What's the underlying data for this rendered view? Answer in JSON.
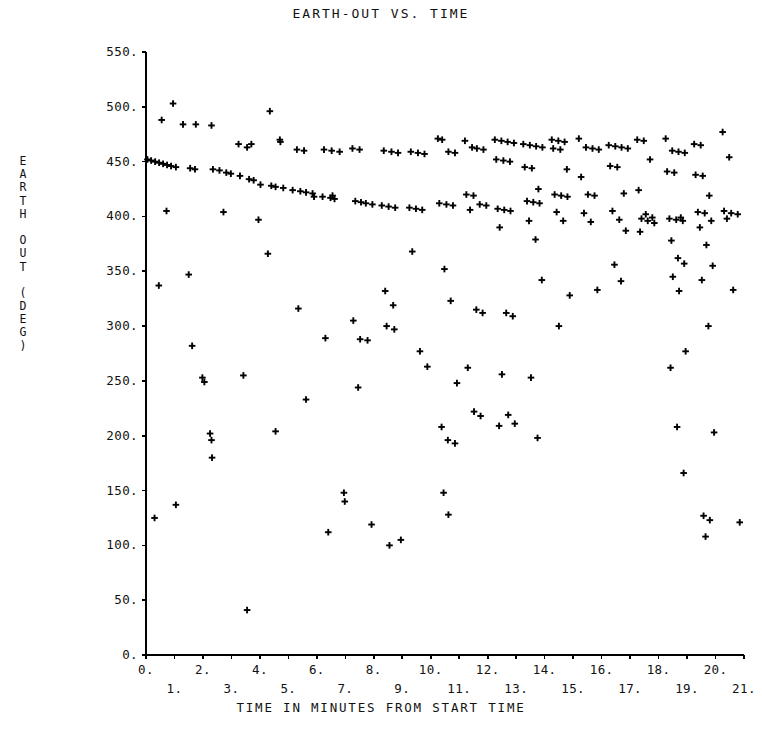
{
  "chart_data": {
    "type": "scatter",
    "title": "EARTH-OUT VS. TIME",
    "xlabel": "TIME IN MINUTES FROM START TIME",
    "ylabel": "EARTH OUT (DEG)",
    "ylabel_chars": [
      "E",
      "A",
      "R",
      "T",
      "H",
      "",
      "O",
      "U",
      "T",
      "",
      "(",
      "D",
      "E",
      "G",
      ")"
    ],
    "xlim": [
      0,
      21
    ],
    "ylim": [
      0,
      550
    ],
    "grid": false,
    "legend": "none",
    "marker": "plus",
    "marker_color": "#000000",
    "xticks": [
      0,
      1,
      2,
      3,
      4,
      5,
      6,
      7,
      8,
      9,
      10,
      11,
      12,
      13,
      14,
      15,
      16,
      17,
      18,
      19,
      20,
      21
    ],
    "xtick_labels_even": [
      "0.",
      "2.",
      "4.",
      "6.",
      "8.",
      "10.",
      "12.",
      "14.",
      "16.",
      "18.",
      "20."
    ],
    "xtick_labels_odd": [
      "1.",
      "3.",
      "5.",
      "7.",
      "9.",
      "11.",
      "13.",
      "15.",
      "17.",
      "19.",
      "21."
    ],
    "yticks": [
      0,
      50,
      100,
      150,
      200,
      250,
      300,
      350,
      400,
      450,
      500,
      550
    ],
    "ytick_labels": [
      "0.",
      "50.",
      "100.",
      "150.",
      "200.",
      "250.",
      "300.",
      "350.",
      "400.",
      "450.",
      "500.",
      "550."
    ],
    "points": [
      [
        0.05,
        452
      ],
      [
        0.18,
        451
      ],
      [
        0.32,
        450
      ],
      [
        0.46,
        449
      ],
      [
        0.6,
        448
      ],
      [
        0.74,
        447
      ],
      [
        0.88,
        446
      ],
      [
        1.05,
        445
      ],
      [
        0.55,
        488
      ],
      [
        0.95,
        503
      ],
      [
        1.3,
        484
      ],
      [
        1.75,
        484
      ],
      [
        1.55,
        444
      ],
      [
        1.72,
        443
      ],
      [
        0.72,
        405
      ],
      [
        0.45,
        337
      ],
      [
        1.05,
        137
      ],
      [
        0.3,
        125
      ],
      [
        2.3,
        483
      ],
      [
        2.35,
        443
      ],
      [
        2.58,
        442
      ],
      [
        2.82,
        440
      ],
      [
        2.98,
        439
      ],
      [
        1.62,
        282
      ],
      [
        1.5,
        347
      ],
      [
        2.05,
        249
      ],
      [
        2.25,
        202
      ],
      [
        2.3,
        196
      ],
      [
        2.32,
        180
      ],
      [
        1.98,
        253
      ],
      [
        2.72,
        404
      ],
      [
        3.55,
        41
      ],
      [
        3.42,
        255
      ],
      [
        3.25,
        466
      ],
      [
        3.7,
        466
      ],
      [
        3.55,
        463
      ],
      [
        3.3,
        437
      ],
      [
        3.62,
        434
      ],
      [
        3.78,
        433
      ],
      [
        4.02,
        429
      ],
      [
        3.95,
        397
      ],
      [
        4.35,
        496
      ],
      [
        4.7,
        470
      ],
      [
        4.72,
        468
      ],
      [
        4.4,
        428
      ],
      [
        4.55,
        427
      ],
      [
        4.82,
        426
      ],
      [
        4.28,
        366
      ],
      [
        4.55,
        204
      ],
      [
        5.3,
        461
      ],
      [
        5.55,
        460
      ],
      [
        5.15,
        424
      ],
      [
        5.42,
        423
      ],
      [
        5.62,
        422
      ],
      [
        5.85,
        421
      ],
      [
        5.9,
        418
      ],
      [
        5.35,
        316
      ],
      [
        5.62,
        233
      ],
      [
        6.25,
        461
      ],
      [
        6.52,
        460
      ],
      [
        6.8,
        459
      ],
      [
        6.2,
        418
      ],
      [
        6.48,
        417
      ],
      [
        6.62,
        416
      ],
      [
        6.55,
        419
      ],
      [
        6.3,
        289
      ],
      [
        6.95,
        148
      ],
      [
        6.98,
        140
      ],
      [
        6.4,
        112
      ],
      [
        7.25,
        462
      ],
      [
        7.5,
        461
      ],
      [
        7.35,
        414
      ],
      [
        7.55,
        413
      ],
      [
        7.72,
        412
      ],
      [
        7.95,
        411
      ],
      [
        7.28,
        305
      ],
      [
        7.52,
        288
      ],
      [
        7.78,
        287
      ],
      [
        7.45,
        244
      ],
      [
        7.92,
        119
      ],
      [
        8.35,
        460
      ],
      [
        8.62,
        459
      ],
      [
        8.85,
        458
      ],
      [
        8.28,
        410
      ],
      [
        8.52,
        409
      ],
      [
        8.75,
        408
      ],
      [
        8.4,
        332
      ],
      [
        8.68,
        319
      ],
      [
        8.45,
        300
      ],
      [
        8.72,
        297
      ],
      [
        8.95,
        105
      ],
      [
        8.55,
        100
      ],
      [
        9.3,
        459
      ],
      [
        9.55,
        458
      ],
      [
        9.78,
        457
      ],
      [
        9.25,
        408
      ],
      [
        9.48,
        407
      ],
      [
        9.7,
        406
      ],
      [
        9.35,
        368
      ],
      [
        9.62,
        277
      ],
      [
        9.88,
        263
      ],
      [
        10.25,
        471
      ],
      [
        10.4,
        470
      ],
      [
        10.62,
        459
      ],
      [
        10.85,
        458
      ],
      [
        10.3,
        412
      ],
      [
        10.55,
        411
      ],
      [
        10.78,
        410
      ],
      [
        10.48,
        352
      ],
      [
        10.7,
        323
      ],
      [
        10.92,
        248
      ],
      [
        10.38,
        208
      ],
      [
        10.6,
        196
      ],
      [
        10.85,
        193
      ],
      [
        10.45,
        148
      ],
      [
        10.62,
        128
      ],
      [
        11.2,
        469
      ],
      [
        11.45,
        463
      ],
      [
        11.62,
        462
      ],
      [
        11.85,
        461
      ],
      [
        11.25,
        420
      ],
      [
        11.5,
        419
      ],
      [
        11.72,
        411
      ],
      [
        11.95,
        410
      ],
      [
        11.38,
        406
      ],
      [
        11.6,
        315
      ],
      [
        11.82,
        312
      ],
      [
        11.3,
        262
      ],
      [
        11.52,
        222
      ],
      [
        11.75,
        218
      ],
      [
        12.25,
        470
      ],
      [
        12.48,
        469
      ],
      [
        12.7,
        468
      ],
      [
        12.92,
        467
      ],
      [
        12.3,
        452
      ],
      [
        12.55,
        451
      ],
      [
        12.78,
        450
      ],
      [
        12.35,
        407
      ],
      [
        12.58,
        406
      ],
      [
        12.8,
        405
      ],
      [
        12.42,
        390
      ],
      [
        12.65,
        312
      ],
      [
        12.88,
        309
      ],
      [
        12.5,
        256
      ],
      [
        12.72,
        219
      ],
      [
        12.95,
        211
      ],
      [
        12.4,
        209
      ],
      [
        13.25,
        466
      ],
      [
        13.48,
        465
      ],
      [
        13.7,
        464
      ],
      [
        13.92,
        463
      ],
      [
        13.3,
        445
      ],
      [
        13.55,
        444
      ],
      [
        13.78,
        425
      ],
      [
        13.38,
        414
      ],
      [
        13.6,
        413
      ],
      [
        13.82,
        412
      ],
      [
        13.45,
        396
      ],
      [
        13.68,
        379
      ],
      [
        13.9,
        342
      ],
      [
        13.52,
        253
      ],
      [
        13.75,
        198
      ],
      [
        14.25,
        470
      ],
      [
        14.48,
        469
      ],
      [
        14.7,
        468
      ],
      [
        14.3,
        462
      ],
      [
        14.55,
        461
      ],
      [
        14.78,
        443
      ],
      [
        14.35,
        420
      ],
      [
        14.58,
        419
      ],
      [
        14.8,
        418
      ],
      [
        14.42,
        404
      ],
      [
        14.65,
        396
      ],
      [
        14.88,
        328
      ],
      [
        14.5,
        300
      ],
      [
        15.2,
        471
      ],
      [
        15.45,
        463
      ],
      [
        15.68,
        462
      ],
      [
        15.9,
        461
      ],
      [
        15.28,
        436
      ],
      [
        15.52,
        420
      ],
      [
        15.75,
        419
      ],
      [
        15.38,
        403
      ],
      [
        15.62,
        395
      ],
      [
        15.85,
        333
      ],
      [
        16.25,
        465
      ],
      [
        16.48,
        464
      ],
      [
        16.7,
        463
      ],
      [
        16.92,
        462
      ],
      [
        16.3,
        446
      ],
      [
        16.55,
        445
      ],
      [
        16.78,
        421
      ],
      [
        16.38,
        405
      ],
      [
        16.62,
        397
      ],
      [
        16.85,
        387
      ],
      [
        16.45,
        356
      ],
      [
        16.68,
        341
      ],
      [
        17.25,
        470
      ],
      [
        17.48,
        469
      ],
      [
        17.7,
        452
      ],
      [
        17.3,
        424
      ],
      [
        17.55,
        402
      ],
      [
        17.78,
        399
      ],
      [
        17.4,
        398
      ],
      [
        17.62,
        396
      ],
      [
        17.85,
        394
      ],
      [
        17.35,
        386
      ],
      [
        18.25,
        471
      ],
      [
        18.48,
        460
      ],
      [
        18.7,
        459
      ],
      [
        18.92,
        458
      ],
      [
        18.3,
        441
      ],
      [
        18.55,
        440
      ],
      [
        18.78,
        399
      ],
      [
        18.38,
        398
      ],
      [
        18.62,
        397
      ],
      [
        18.85,
        396
      ],
      [
        18.45,
        378
      ],
      [
        18.68,
        362
      ],
      [
        18.9,
        357
      ],
      [
        18.5,
        345
      ],
      [
        18.72,
        332
      ],
      [
        18.95,
        277
      ],
      [
        18.42,
        262
      ],
      [
        18.65,
        208
      ],
      [
        18.88,
        166
      ],
      [
        19.25,
        466
      ],
      [
        19.48,
        465
      ],
      [
        19.3,
        438
      ],
      [
        19.55,
        437
      ],
      [
        19.78,
        419
      ],
      [
        19.38,
        404
      ],
      [
        19.62,
        403
      ],
      [
        19.85,
        396
      ],
      [
        19.45,
        390
      ],
      [
        19.68,
        374
      ],
      [
        19.9,
        355
      ],
      [
        19.52,
        342
      ],
      [
        19.75,
        300
      ],
      [
        19.95,
        203
      ],
      [
        19.58,
        127
      ],
      [
        19.8,
        123
      ],
      [
        19.65,
        108
      ],
      [
        20.25,
        477
      ],
      [
        20.48,
        454
      ],
      [
        20.3,
        405
      ],
      [
        20.55,
        403
      ],
      [
        20.78,
        402
      ],
      [
        20.4,
        398
      ],
      [
        20.62,
        333
      ],
      [
        20.85,
        121
      ]
    ]
  }
}
